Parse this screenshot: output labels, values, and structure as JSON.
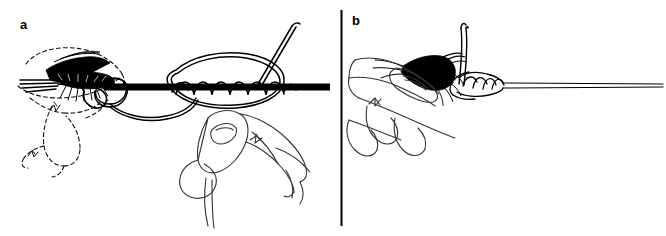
{
  "figure": {
    "background_color": "#ffffff",
    "ink_color": "#000000",
    "width": 666,
    "height": 236,
    "style": "pen-and-ink line drawing",
    "panel_count": 2
  },
  "panels": [
    {
      "id": "a",
      "label": "a",
      "caption": "",
      "description": "A wet fly with dark hackle wing and hook is attached to a heavy dark fly line; a loop of leader is wrapped in a spiral of coils around the line while a hand pinches the knot; dashed outlines show the prior position of the fly.",
      "elements": {
        "fly": "wet fly with dark wing, hackle and hook eye at left",
        "main_line": "thick black horizontal fly line",
        "coils": "spiral wraps of leader around main line",
        "loop": "large open loop of leader",
        "tag_end": "tag end of leader angled up to the right",
        "ghost_lines": "dashed construction lines showing fly motion",
        "hand": "thumb and fingers pinching the knot from below right"
      }
    },
    {
      "id": "b",
      "label": "b",
      "caption": "",
      "description": "Close-up of the finished knot: fingers pinch the fly head while the tightened coils sit against a thin leader that runs off to the right; a short tag end stands up from the knot.",
      "elements": {
        "fly_head": "dark hackle and head of the fly held between fingertips",
        "knot": "tightened spiral coils forming the completed knot",
        "leader": "thin double-ruled leader extending to the right edge",
        "tag_end": "short tag end standing up from the knot",
        "hand": "index finger and thumb gripping the fly, folded fingers below"
      }
    }
  ],
  "divider": {
    "name": "vertical-panel-divider",
    "orientation": "vertical",
    "color": "#000000"
  }
}
